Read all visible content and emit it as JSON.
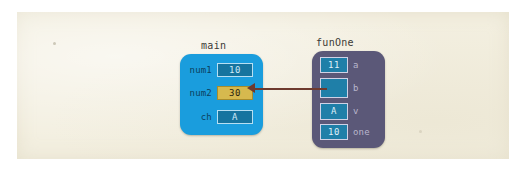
{
  "diagram": {
    "background_color": "#f3efe0",
    "frames": [
      {
        "id": "main",
        "name": "main",
        "color": "#1a9ddd",
        "rows": [
          {
            "label": "num1",
            "value": "10",
            "highlighted": false
          },
          {
            "label": "num2",
            "value": "30",
            "highlighted": true
          },
          {
            "label": "ch",
            "value": "A",
            "highlighted": false
          }
        ]
      },
      {
        "id": "funOne",
        "name": "funOne",
        "color": "#5b5878",
        "rows": [
          {
            "label": "a",
            "value": "11",
            "empty": false
          },
          {
            "label": "b",
            "value": "",
            "empty": true
          },
          {
            "label": "v",
            "value": "A",
            "empty": false
          },
          {
            "label": "one",
            "value": "10",
            "empty": false
          }
        ]
      }
    ],
    "connector": {
      "from": "funOne.b",
      "to": "main.num2",
      "color": "#6e3a2e",
      "direction": "left"
    },
    "colors": {
      "main_frame": "#1a9ddd",
      "funone_frame": "#5b5878",
      "cell": "#16749f",
      "highlight_cell": "#d6b94e",
      "arrow": "#6e3a2e",
      "paper": "#f3efe0"
    }
  }
}
